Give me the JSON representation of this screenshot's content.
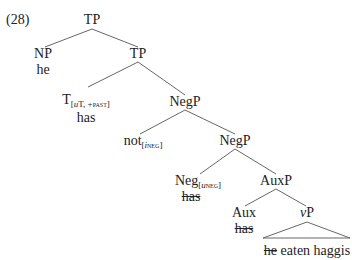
{
  "example_number": "(28)",
  "tree": {
    "root": {
      "label": "TP"
    },
    "np": {
      "label": "NP",
      "word": "he"
    },
    "tp2": {
      "label": "TP"
    },
    "t": {
      "label": "T",
      "features_pre": "[",
      "feature_u": "u",
      "features_mid": "T, +",
      "feature_sc": "past",
      "features_post": "]",
      "word": "has"
    },
    "negp1": {
      "label": "NegP"
    },
    "not": {
      "label": "not",
      "features_pre": "[",
      "feature_i": "i",
      "feature_sc": "neg",
      "features_post": "]"
    },
    "negp2": {
      "label": "NegP"
    },
    "neg": {
      "label": "Neg",
      "features_pre": "[",
      "feature_u": "u",
      "feature_sc": "neg",
      "features_post": "]",
      "word": "has",
      "word_struck": true
    },
    "auxp": {
      "label": "AuxP"
    },
    "aux": {
      "label": "Aux",
      "word": "has",
      "word_struck": true
    },
    "vp": {
      "label_v": "v",
      "label_p": "P"
    },
    "vp_yield": {
      "struck": "he",
      "rest": " eaten haggis"
    }
  }
}
